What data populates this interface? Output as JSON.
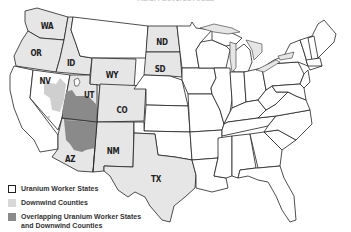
{
  "title": "RECA Covered Areas",
  "colors": {
    "uranium_worker_state": "#e6e6e6",
    "downwind_counties": "#cfcfcf",
    "overlap": "#8a8a8a",
    "other_state": "#ffffff",
    "border": "#222222"
  },
  "state_labels": {
    "WA": "WA",
    "OR": "OR",
    "ID": "ID",
    "NV": "NV",
    "UT": "UT",
    "AZ": "AZ",
    "WY": "WY",
    "CO": "CO",
    "NM": "NM",
    "ND": "ND",
    "SD": "SD",
    "TX": "TX"
  },
  "highlighted_states": [
    "WA",
    "OR",
    "ID",
    "WY",
    "ND",
    "SD",
    "UT",
    "CO",
    "AZ",
    "NM",
    "TX"
  ],
  "legend": {
    "items": [
      {
        "label": "Uranium Worker States",
        "swatch": "outlined"
      },
      {
        "label": "Downwind Counties",
        "swatch": "light-gray"
      },
      {
        "label": "Overlapping Uranium Worker States",
        "label2": "and Downwind Counties",
        "swatch": "dark-gray"
      }
    ]
  }
}
